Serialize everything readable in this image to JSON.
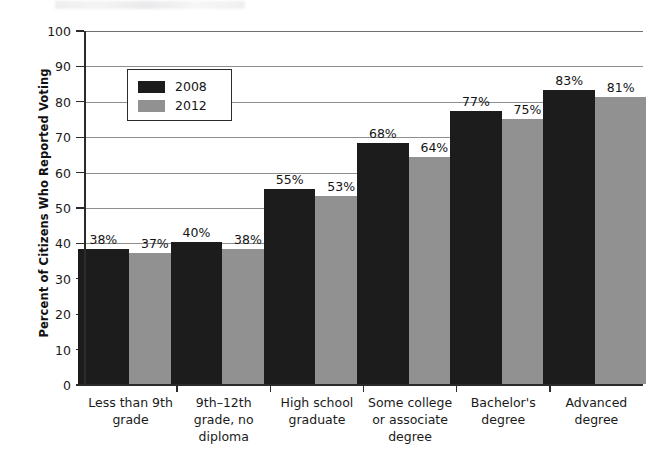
{
  "chart_data": {
    "type": "bar",
    "title": "",
    "xlabel": "",
    "ylabel": "Percent of Citizens Who Reported Voting",
    "ylim": [
      0,
      100
    ],
    "ytick_step": 10,
    "grid": true,
    "legend_position": "upper-left-inside",
    "categories": [
      "Less than 9th grade",
      "9th–12th grade, no diploma",
      "High school graduate",
      "Some college or associate degree",
      "Bachelor's degree",
      "Advanced degree"
    ],
    "category_lines": [
      [
        "Less than 9th",
        "grade"
      ],
      [
        "9th–12th",
        "grade, no",
        "diploma"
      ],
      [
        "High school",
        "graduate"
      ],
      [
        "Some college",
        "or associate",
        "degree"
      ],
      [
        "Bachelor's",
        "degree"
      ],
      [
        "Advanced",
        "degree"
      ]
    ],
    "series": [
      {
        "name": "2008",
        "color": "#1c1c1c",
        "values": [
          38,
          40,
          55,
          68,
          77,
          83
        ],
        "value_labels": [
          "38%",
          "40%",
          "55%",
          "68%",
          "77%",
          "83%"
        ]
      },
      {
        "name": "2012",
        "color": "#919191",
        "values": [
          37,
          38,
          53,
          64,
          75,
          81
        ],
        "value_labels": [
          "37%",
          "38%",
          "53%",
          "64%",
          "75%",
          "81%"
        ]
      }
    ],
    "ytick_labels": [
      "0",
      "10",
      "20",
      "30",
      "40",
      "50",
      "60",
      "70",
      "80",
      "90",
      "100"
    ]
  },
  "legend": {
    "items": [
      {
        "label": "2008",
        "color": "#1c1c1c"
      },
      {
        "label": "2012",
        "color": "#919191"
      }
    ]
  },
  "axes": {
    "y_title": "Percent of Citizens Who Reported Voting"
  }
}
